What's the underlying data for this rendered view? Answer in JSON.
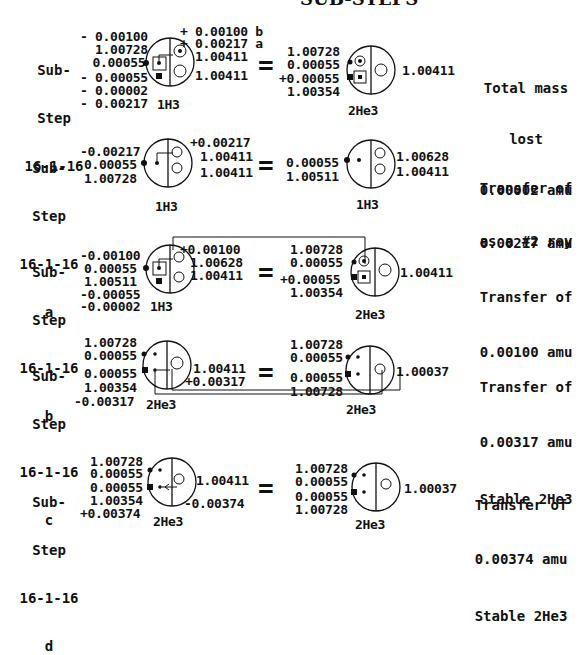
{
  "title": "SUB-STEPS",
  "rows": [
    {
      "step": {
        "l1": "Sub-",
        "l2": "Step",
        "l3": "16-1-16",
        "l4": ""
      },
      "left_values": [
        "- 0.00100",
        "  1.00728",
        " 0.00055",
        "- 0.00055",
        "- 0.00002",
        "- 0.00217"
      ],
      "right_values": [
        "+ 0.00100 b",
        "+ 0.00217 a",
        "1.00411",
        "1.00411"
      ],
      "left_atom": "1H3",
      "result_values": [
        "1.00728",
        "0.00055",
        "+0.00055",
        "1.00354"
      ],
      "result_right": "1.00411",
      "result_atom": "2He3",
      "note": [
        "Total mass",
        "lost",
        "0.00002 amu",
        "as a #2 ray"
      ]
    },
    {
      "step": {
        "l1": "Sub-",
        "l2": "Step",
        "l3": "16-1-16",
        "l4": "a"
      },
      "left_values": [
        "-0.00217",
        "0.00055",
        "1.00728"
      ],
      "right_values": [
        "+0.00217",
        "1.00411",
        "1.00411"
      ],
      "left_atom": "1H3",
      "result_values": [
        "0.00055",
        "1.00511"
      ],
      "result_right": [
        "1.00628",
        "1.00411"
      ],
      "result_atom": "1H3",
      "note": [
        "Transfer of",
        "0.00217 amu"
      ]
    },
    {
      "step": {
        "l1": "Sub-",
        "l2": "Step",
        "l3": "16-1-16",
        "l4": "b"
      },
      "left_values": [
        "-0.00100",
        "0.00055",
        "1.00511",
        "-0.00055",
        "-0.00002"
      ],
      "right_values": [
        "+0.00100",
        "1.00628",
        "1.00411"
      ],
      "left_atom": "1H3",
      "result_values": [
        "1.00728",
        "0.00055",
        "+0.00055",
        "1.00354"
      ],
      "result_right": "1.00411",
      "result_atom": "2He3",
      "note": [
        "Transfer of",
        "0.00100 amu"
      ]
    },
    {
      "step": {
        "l1": "Sub-",
        "l2": "Step",
        "l3": "16-1-16",
        "l4": "c"
      },
      "left_values": [
        "1.00728",
        "0.00055",
        "0.00055",
        "1.00354",
        "-0.00317"
      ],
      "right_values": [
        "1.00411",
        "+0.00317"
      ],
      "left_atom": "2He3",
      "result_values": [
        "1.00728",
        "0.00055",
        "0.00055",
        "1.00728"
      ],
      "result_right": "1.00037",
      "result_atom": "2He3",
      "note": [
        "Transfer of",
        "0.00317 amu",
        "Stable 2He3"
      ]
    },
    {
      "step": {
        "l1": "Sub-",
        "l2": "Step",
        "l3": "16-1-16",
        "l4": "d"
      },
      "left_values": [
        "1.00728",
        "0.00055",
        "0.00055",
        "1.00354",
        "+0.00374"
      ],
      "right_values": [
        "1.00411",
        "-0.00374"
      ],
      "left_atom": "2He3",
      "result_values": [
        "1.00728",
        "0.00055",
        "0.00055",
        "1.00728"
      ],
      "result_right": "1.00037",
      "result_atom": "2He3",
      "note": [
        "Transfer of",
        "0.00374 amu",
        "Stable 2He3"
      ]
    }
  ],
  "equals": "="
}
